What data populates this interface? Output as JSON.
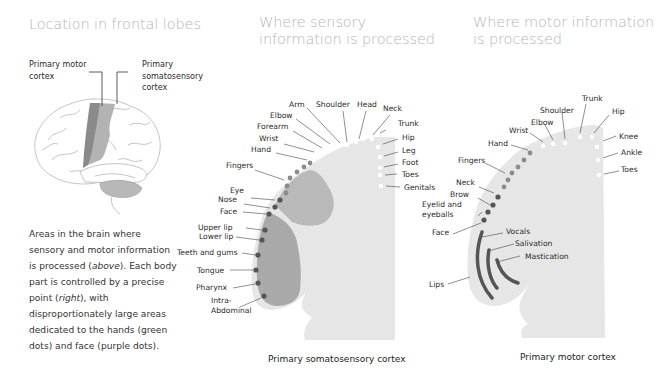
{
  "panels": {
    "location": {
      "title": "Location in frontal lobes",
      "labels": {
        "motor": [
          "Primary motor",
          "cortex"
        ],
        "sensory": [
          "Primary",
          "somatosensory",
          "cortex"
        ]
      },
      "description": {
        "p1": "Areas in the brain where sensory and motor information is processed (",
        "above": "above",
        "p2": "). Each body part is controlled by a precise point (",
        "right": "right",
        "p3": "), with disproportionately large areas dedicated to the hands (green dots) and face (purple dots)."
      }
    },
    "sensory": {
      "title_line1": "Where sensory",
      "title_line2": "information is processed",
      "caption": "Primary somatosensory cortex",
      "labels": [
        "Arm",
        "Shoulder",
        "Head",
        "Neck",
        "Elbow",
        "Forearm",
        "Wrist",
        "Hand",
        "Trunk",
        "Hip",
        "Leg",
        "Foot",
        "Toes",
        "Genitals",
        "Fingers",
        "Eye",
        "Nose",
        "Face",
        "Upper lip",
        "Lower lip",
        "Teeth and gums",
        "Tongue",
        "Pharynx",
        "Intra-",
        "Abdominal"
      ]
    },
    "motor": {
      "title_line1": "Where motor information",
      "title_line2": "is processed",
      "caption": "Primary motor cortex",
      "labels": [
        "Trunk",
        "Shoulder",
        "Hip",
        "Elbow",
        "Wrist",
        "Hand",
        "Knee",
        "Ankle",
        "Toes",
        "Fingers",
        "Neck",
        "Brow",
        "Eyelid and",
        "eyeballs",
        "Face",
        "Vocals",
        "Salivation",
        "Mastication",
        "Lips"
      ]
    }
  },
  "colors": {
    "cortex_bg": "#e6e6e6",
    "hand_region": "#b9b9b9",
    "face_region": "#a9a9a9",
    "hand_dots": "#8c8c8c",
    "face_dots": "#555555",
    "body_dots": "#ffffff",
    "title": "#b5b5b5"
  }
}
